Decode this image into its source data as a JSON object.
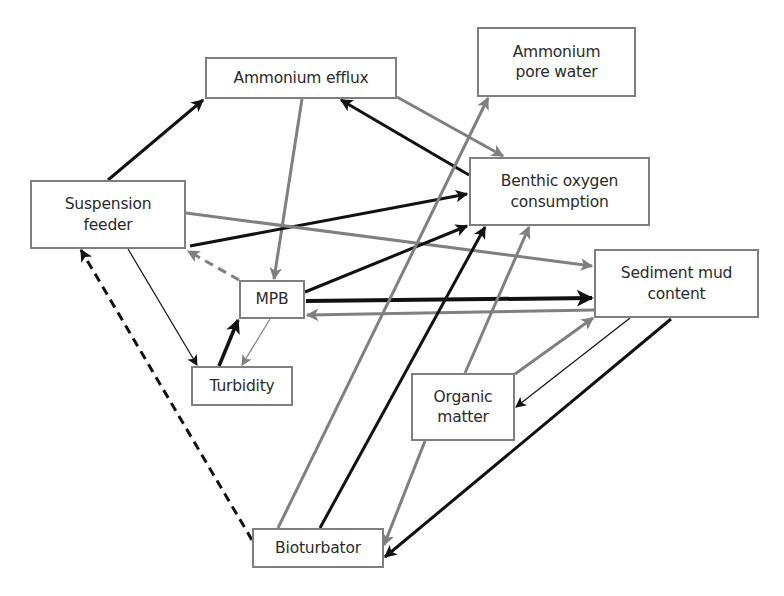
{
  "diagram": {
    "type": "causal-network",
    "colors": {
      "black_edge": "#111111",
      "gray_edge": "#808080",
      "node_border": "#7f7f7f",
      "text": "#2b2b2b"
    },
    "nodes": [
      {
        "id": "ammonium_efflux",
        "label": "Ammonium efflux",
        "x": 205,
        "y": 57,
        "w": 192,
        "h": 42
      },
      {
        "id": "ammonium_pore_water",
        "label": "Ammonium\npore water",
        "x": 477,
        "y": 27,
        "w": 159,
        "h": 70
      },
      {
        "id": "suspension_feeder",
        "label": "Suspension\nfeeder",
        "x": 30,
        "y": 180,
        "w": 156,
        "h": 69
      },
      {
        "id": "benthic_oxygen_consumption",
        "label": "Benthic oxygen\nconsumption",
        "x": 469,
        "y": 157,
        "w": 181,
        "h": 69
      },
      {
        "id": "sediment_mud_content",
        "label": "Sediment mud\ncontent",
        "x": 594,
        "y": 249,
        "w": 165,
        "h": 69
      },
      {
        "id": "mpb",
        "label": "MPB",
        "x": 239,
        "y": 280,
        "w": 66,
        "h": 39
      },
      {
        "id": "turbidity",
        "label": "Turbidity",
        "x": 191,
        "y": 366,
        "w": 102,
        "h": 40
      },
      {
        "id": "organic_matter",
        "label": "Organic\nmatter",
        "x": 411,
        "y": 373,
        "w": 104,
        "h": 68
      },
      {
        "id": "bioturbator",
        "label": "Bioturbator",
        "x": 252,
        "y": 528,
        "w": 132,
        "h": 40
      }
    ],
    "edges": [
      {
        "from": "suspension_feeder",
        "to": "ammonium_efflux",
        "color": "black",
        "width": 3,
        "dashed": false,
        "x1": 108,
        "y1": 180,
        "x2": 203,
        "y2": 100
      },
      {
        "from": "ammonium_efflux",
        "to": "mpb",
        "color": "gray",
        "width": 3,
        "dashed": false,
        "x1": 302,
        "y1": 99,
        "x2": 274,
        "y2": 279
      },
      {
        "from": "ammonium_efflux",
        "to": "benthic_oxygen_consumption",
        "color": "gray",
        "width": 3,
        "dashed": false,
        "x1": 397,
        "y1": 97,
        "x2": 503,
        "y2": 156
      },
      {
        "from": "benthic_oxygen_consumption",
        "to": "ammonium_efflux",
        "color": "black",
        "width": 3,
        "dashed": false,
        "x1": 469,
        "y1": 175,
        "x2": 341,
        "y2": 100
      },
      {
        "from": "suspension_feeder",
        "to": "benthic_oxygen_consumption",
        "color": "black",
        "width": 3,
        "dashed": false,
        "x1": 190,
        "y1": 246,
        "x2": 467,
        "y2": 194
      },
      {
        "from": "suspension_feeder",
        "to": "sediment_mud_content",
        "color": "gray",
        "width": 3,
        "dashed": false,
        "x1": 186,
        "y1": 213,
        "x2": 592,
        "y2": 266
      },
      {
        "from": "mpb",
        "to": "suspension_feeder",
        "color": "gray",
        "width": 3,
        "dashed": true,
        "x1": 239,
        "y1": 280,
        "x2": 188,
        "y2": 251
      },
      {
        "from": "suspension_feeder",
        "to": "turbidity",
        "color": "black",
        "width": 1.2,
        "dashed": false,
        "x1": 128,
        "y1": 249,
        "x2": 197,
        "y2": 365
      },
      {
        "from": "turbidity",
        "to": "mpb",
        "color": "black",
        "width": 3.5,
        "dashed": false,
        "x1": 219,
        "y1": 366,
        "x2": 238,
        "y2": 320
      },
      {
        "from": "mpb",
        "to": "turbidity",
        "color": "gray",
        "width": 1.2,
        "dashed": false,
        "x1": 270,
        "y1": 319,
        "x2": 242,
        "y2": 365
      },
      {
        "from": "mpb",
        "to": "benthic_oxygen_consumption",
        "color": "black",
        "width": 3,
        "dashed": false,
        "x1": 305,
        "y1": 292,
        "x2": 467,
        "y2": 226
      },
      {
        "from": "mpb",
        "to": "sediment_mud_content",
        "color": "black",
        "width": 4,
        "dashed": false,
        "x1": 306,
        "y1": 301,
        "x2": 592,
        "y2": 298
      },
      {
        "from": "sediment_mud_content",
        "to": "mpb",
        "color": "gray",
        "width": 3,
        "dashed": false,
        "x1": 594,
        "y1": 310,
        "x2": 307,
        "y2": 315
      },
      {
        "from": "bioturbator",
        "to": "ammonium_pore_water",
        "color": "gray",
        "width": 3,
        "dashed": false,
        "x1": 278,
        "y1": 528,
        "x2": 488,
        "y2": 98
      },
      {
        "from": "bioturbator",
        "to": "benthic_oxygen_consumption",
        "color": "black",
        "width": 3,
        "dashed": false,
        "x1": 320,
        "y1": 528,
        "x2": 485,
        "y2": 227
      },
      {
        "from": "organic_matter",
        "to": "benthic_oxygen_consumption",
        "color": "gray",
        "width": 3,
        "dashed": false,
        "x1": 465,
        "y1": 373,
        "x2": 529,
        "y2": 227
      },
      {
        "from": "organic_matter",
        "to": "sediment_mud_content",
        "color": "gray",
        "width": 3,
        "dashed": false,
        "x1": 515,
        "y1": 374,
        "x2": 593,
        "y2": 318
      },
      {
        "from": "sediment_mud_content",
        "to": "organic_matter",
        "color": "black",
        "width": 1.2,
        "dashed": false,
        "x1": 630,
        "y1": 318,
        "x2": 516,
        "y2": 407
      },
      {
        "from": "organic_matter",
        "to": "bioturbator",
        "color": "gray",
        "width": 3,
        "dashed": false,
        "x1": 425,
        "y1": 441,
        "x2": 384,
        "y2": 545
      },
      {
        "from": "sediment_mud_content",
        "to": "bioturbator",
        "color": "black",
        "width": 3,
        "dashed": false,
        "x1": 671,
        "y1": 319,
        "x2": 385,
        "y2": 557
      },
      {
        "from": "bioturbator",
        "to": "suspension_feeder",
        "color": "black",
        "width": 3,
        "dashed": true,
        "x1": 252,
        "y1": 540,
        "x2": 81,
        "y2": 250
      }
    ]
  }
}
